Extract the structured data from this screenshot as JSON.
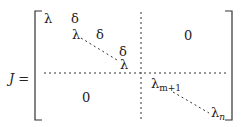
{
  "equation": {
    "lhs": "J =",
    "lambda": "λ",
    "delta": "δ",
    "zero": "0",
    "lambda_m1_base": "λ",
    "lambda_m1_sub": "m+1",
    "lambda_n_base": "λ",
    "lambda_n_sub": "n"
  }
}
